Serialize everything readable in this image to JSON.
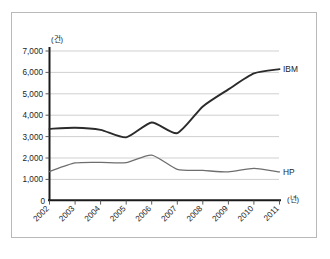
{
  "chart_data": {
    "type": "line",
    "title": "",
    "xlabel": "(년)",
    "ylabel": "(건)",
    "categories": [
      "2002",
      "2003",
      "2004",
      "2005",
      "2006",
      "2007",
      "2008",
      "2009",
      "2010",
      "2011"
    ],
    "ylim": [
      0,
      7000
    ],
    "xlim": [
      "2002",
      "2011"
    ],
    "ytick_labels": [
      "7,000",
      "6,000",
      "5,000",
      "4,000",
      "3,000",
      "2,000",
      "1,000",
      "0"
    ],
    "ytick_values": [
      7000,
      6000,
      5000,
      4000,
      3000,
      2000,
      1000,
      0
    ],
    "grid": "horizontal",
    "legend_position": "inline-right-of-line-end",
    "series": [
      {
        "name": "IBM",
        "values": [
          3350,
          3400,
          3300,
          2950,
          3650,
          3150,
          4400,
          5200,
          5950,
          6150
        ],
        "color": "#2b2b2b",
        "label_text": "IBM"
      },
      {
        "name": "HP",
        "values": [
          1350,
          1750,
          1780,
          1770,
          2120,
          1450,
          1400,
          1330,
          1500,
          1330
        ],
        "color": "#6e6e6e",
        "label_text": "HP"
      }
    ]
  },
  "axis": {
    "y_unit": "(건)",
    "x_unit": "(년)",
    "origin_label": "0"
  },
  "frame": {
    "border_color": "#b9b9b9",
    "background": "#ffffff"
  }
}
